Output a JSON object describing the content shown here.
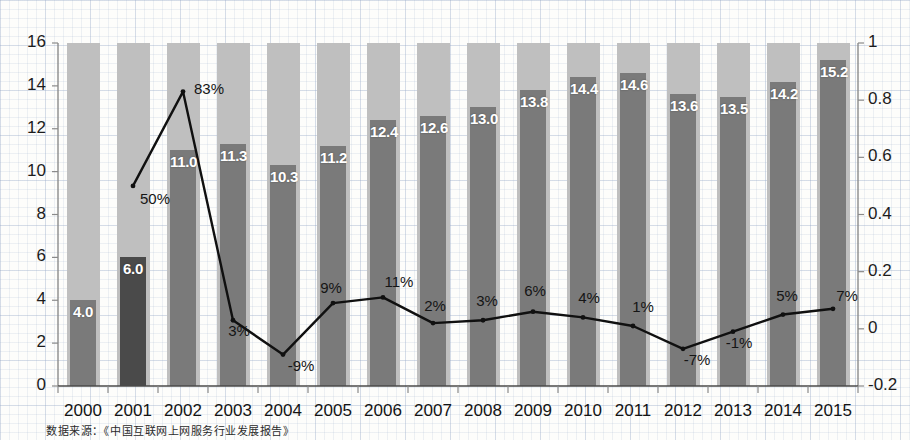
{
  "chart_data": {
    "type": "bar",
    "title": "",
    "subtitle": "",
    "xlabel": "",
    "ylabel": "",
    "grid": false,
    "legend_position": "none",
    "categories": [
      "2000",
      "2001",
      "2002",
      "2003",
      "2004",
      "2005",
      "2006",
      "2007",
      "2008",
      "2009",
      "2010",
      "2011",
      "2012",
      "2013",
      "2014",
      "2015"
    ],
    "ylim": [
      0,
      16
    ],
    "y_ticks": [
      "0",
      "2",
      "4",
      "6",
      "8",
      "10",
      "12",
      "14",
      "16"
    ],
    "y2lim": [
      -0.2,
      1
    ],
    "y2_ticks": [
      "-0.2",
      "0",
      "0.2",
      "0.4",
      "0.6",
      "0.8",
      "1"
    ],
    "series": [
      {
        "name": "bars",
        "type": "bar",
        "axis": "left",
        "values": [
          4.0,
          6.0,
          11.0,
          11.3,
          10.3,
          11.2,
          12.4,
          12.6,
          13.0,
          13.8,
          14.4,
          14.6,
          13.6,
          13.5,
          14.2,
          15.2
        ],
        "value_labels": [
          "4.0",
          "6.0",
          "11.0",
          "11.3",
          "10.3",
          "11.2",
          "12.4",
          "12.6",
          "13.0",
          "13.8",
          "14.4",
          "14.6",
          "13.6",
          "13.5",
          "14.2",
          "15.2"
        ]
      },
      {
        "name": "growth-rate",
        "type": "line",
        "axis": "right",
        "values": [
          null,
          0.5,
          0.83,
          0.03,
          -0.09,
          0.09,
          0.11,
          0.02,
          0.03,
          0.06,
          0.04,
          0.01,
          -0.07,
          -0.01,
          0.05,
          0.07
        ],
        "value_labels": [
          null,
          "50%",
          "83%",
          "3%",
          "-9%",
          "9%",
          "11%",
          "2%",
          "3%",
          "6%",
          "4%",
          "1%",
          "-7%",
          "-1%",
          "5%",
          "7%"
        ]
      }
    ]
  },
  "footnote": {
    "text": "数据来源：《中国互联网上网服务行业发展报告》"
  },
  "colors": {
    "bar": "#7a7a7a",
    "bar_highlight": "#4a4a4a",
    "band": "#bfbfbf",
    "line": "#101010",
    "axis": "#8a8a8a",
    "text": "#141414"
  }
}
